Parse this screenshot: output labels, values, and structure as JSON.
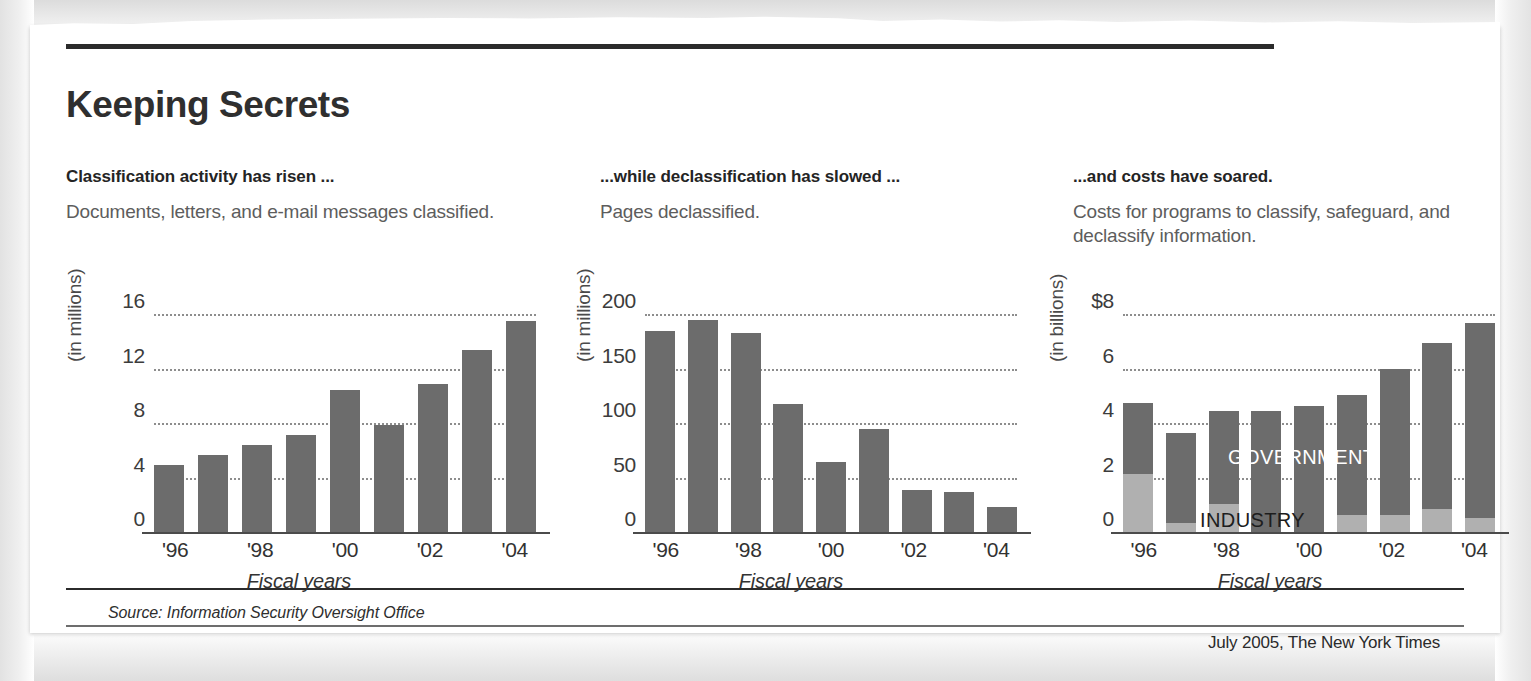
{
  "headline": "Keeping Secrets",
  "source_note": "Source: Information Security Oversight Office",
  "credit_note": "July 2005, The New York Times",
  "panels": [
    {
      "subhead": "Classification activity has risen ...",
      "description": "Documents, letters, and e-mail messages classified."
    },
    {
      "subhead": "...while declassification has slowed ...",
      "description": "Pages declassified."
    },
    {
      "subhead": "...and costs have soared.",
      "description": "Costs for programs to classify, safeguard, and declassify information."
    }
  ],
  "series_labels": {
    "government": "GOVERNMENT",
    "industry": "INDUSTRY"
  },
  "colors": {
    "bar_dark": "#6c6c6c",
    "bar_light": "#b0b0b0",
    "rule": "#2b2b2b",
    "paper": "#ffffff"
  },
  "chart_data": [
    {
      "type": "bar",
      "title": "Classification activity has risen ...",
      "subtitle": "Documents, letters, and e-mail messages classified.",
      "xlabel": "Fiscal years",
      "ylabel": "(in millions)",
      "x": [
        "1996",
        "1997",
        "1998",
        "1999",
        "2000",
        "2001",
        "2002",
        "2003",
        "2004"
      ],
      "categories": [
        "'96",
        "",
        "'98",
        "",
        "'00",
        "",
        "'02",
        "",
        "'04"
      ],
      "tick_labels": [
        "'96",
        "'98",
        "'00",
        "'02",
        "'04"
      ],
      "values": [
        5.1,
        5.8,
        6.5,
        7.3,
        10.6,
        8.0,
        11.0,
        13.5,
        15.6
      ],
      "ylim": [
        0,
        16
      ],
      "yticks": [
        0,
        4,
        8,
        12,
        16
      ],
      "ytick_labels": [
        "0",
        "4",
        "8",
        "12",
        "16"
      ],
      "grid": true,
      "legend": "none"
    },
    {
      "type": "bar",
      "title": "...while declassification has slowed ...",
      "subtitle": "Pages declassified.",
      "xlabel": "Fiscal years",
      "ylabel": "(in millions)",
      "x": [
        "1996",
        "1997",
        "1998",
        "1999",
        "2000",
        "2001",
        "2002",
        "2003",
        "2004"
      ],
      "categories": [
        "'96",
        "",
        "'98",
        "",
        "'00",
        "",
        "'02",
        "",
        "'04"
      ],
      "tick_labels": [
        "'96",
        "'98",
        "'00",
        "'02",
        "'04"
      ],
      "values": [
        186,
        196,
        184,
        119,
        66,
        96,
        40,
        39,
        25
      ],
      "ylim": [
        0,
        200
      ],
      "yticks": [
        0,
        50,
        100,
        150,
        200
      ],
      "ytick_labels": [
        "0",
        "50",
        "100",
        "150",
        "200"
      ],
      "grid": true,
      "legend": "none"
    },
    {
      "type": "bar",
      "stacked": true,
      "title": "...and costs have soared.",
      "subtitle": "Costs for programs to classify, safeguard, and declassify information.",
      "xlabel": "Fiscal years",
      "ylabel": "(in billions)",
      "x": [
        "1996",
        "1997",
        "1998",
        "1999",
        "2000",
        "2001",
        "2002",
        "2003",
        "2004"
      ],
      "categories": [
        "'96",
        "",
        "'98",
        "",
        "'00",
        "",
        "'02",
        "",
        "'04"
      ],
      "tick_labels": [
        "'96",
        "'98",
        "'00",
        "'02",
        "'04"
      ],
      "series": [
        {
          "name": "INDUSTRY",
          "values": [
            2.2,
            0.4,
            1.1,
            0.0,
            0.0,
            0.7,
            0.7,
            0.9,
            0.6
          ]
        },
        {
          "name": "GOVERNMENT",
          "values": [
            2.6,
            3.3,
            3.4,
            4.5,
            4.7,
            4.4,
            5.35,
            6.1,
            7.15
          ]
        }
      ],
      "totals": [
        4.8,
        3.7,
        4.5,
        4.5,
        4.7,
        5.1,
        6.05,
        7.0,
        7.75
      ],
      "ylim": [
        0,
        8
      ],
      "yticks": [
        0,
        2,
        4,
        6,
        8
      ],
      "ytick_labels": [
        "0",
        "2",
        "4",
        "6",
        "$8"
      ],
      "grid": true,
      "legend": "in-plot"
    }
  ]
}
